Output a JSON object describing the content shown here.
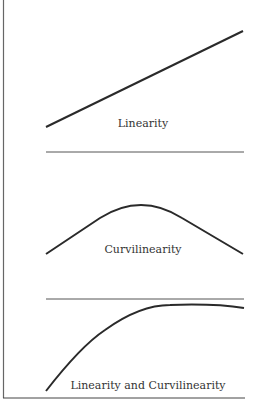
{
  "figure": {
    "panels": [
      {
        "id": "linearity",
        "label": "Linearity"
      },
      {
        "id": "curvilinearity",
        "label": "Curvilinearity"
      },
      {
        "id": "linearity-and-curvilinearity",
        "label": "Linearity and Curvilinearity"
      }
    ],
    "colors": {
      "line": "#2a2a2a",
      "frame": "#555555",
      "divider": "#555555"
    }
  }
}
